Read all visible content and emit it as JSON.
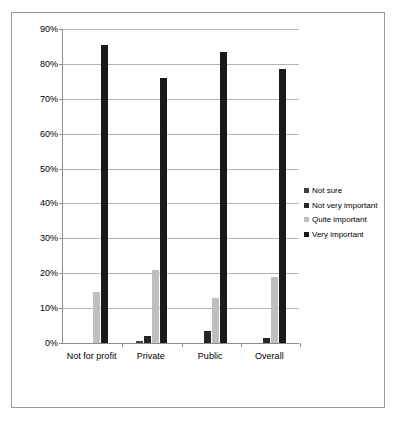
{
  "chart_data": {
    "type": "bar",
    "title": "",
    "subtitle": "",
    "xlabel": "",
    "ylabel": "",
    "categories": [
      "Not for profit",
      "Private",
      "Public",
      "Overall"
    ],
    "series": [
      {
        "name": "Not sure",
        "color": "#404040",
        "values": [
          0,
          0.7,
          0,
          0
        ]
      },
      {
        "name": "Not very important",
        "color": "#262626",
        "values": [
          0,
          2.0,
          3.5,
          1.5
        ]
      },
      {
        "name": "Quite important",
        "color": "#bfbfbf",
        "values": [
          14.5,
          21.0,
          13.0,
          19.0
        ]
      },
      {
        "name": "Very important",
        "color": "#1a1a1a",
        "values": [
          85.5,
          76.0,
          83.5,
          78.5
        ]
      }
    ],
    "ylim": [
      0,
      90
    ],
    "ytick_labels": [
      "0%",
      "10%",
      "20%",
      "30%",
      "40%",
      "50%",
      "60%",
      "70%",
      "80%",
      "90%"
    ],
    "ytick_values": [
      0,
      10,
      20,
      30,
      40,
      50,
      60,
      70,
      80,
      90
    ],
    "grid": true,
    "legend_position": "right",
    "value_suffix": "%"
  },
  "legend": {
    "items": [
      {
        "label": "Not sure",
        "color": "#404040"
      },
      {
        "label": "Not very important",
        "color": "#262626"
      },
      {
        "label": "Quite important",
        "color": "#bfbfbf"
      },
      {
        "label": "Very important",
        "color": "#1a1a1a"
      }
    ]
  },
  "frame": {
    "border_color": "#9a9a9a",
    "background": "#ffffff"
  }
}
